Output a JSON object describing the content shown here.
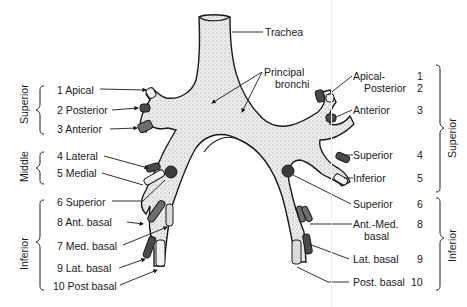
{
  "diagram": {
    "trachea_label": "Trachea",
    "principal_bronchi_label": [
      "Principal",
      "bronchi"
    ],
    "left_side": {
      "groups": [
        {
          "name": "Superior",
          "segments": [
            {
              "num": "1",
              "label": "1 Apical"
            },
            {
              "num": "2",
              "label": "2 Posterior"
            },
            {
              "num": "3",
              "label": "3 Anterior"
            }
          ]
        },
        {
          "name": "Middle",
          "segments": [
            {
              "num": "4",
              "label": "4 Lateral"
            },
            {
              "num": "5",
              "label": "5 Medial"
            }
          ]
        },
        {
          "name": "Inferior",
          "segments": [
            {
              "num": "6",
              "label": "6 Superior"
            },
            {
              "num": "8",
              "label": "8 Ant. basal"
            },
            {
              "num": "7",
              "label": "7 Med. basal"
            },
            {
              "num": "9",
              "label": "9 Lat. basal"
            },
            {
              "num": "10",
              "label": "10 Post basal"
            }
          ]
        }
      ]
    },
    "right_side": {
      "groups": [
        {
          "name": "Superior",
          "segments": [
            {
              "num": "1",
              "label": "Apical-"
            },
            {
              "num": "2",
              "label": "Posterior"
            },
            {
              "num": "3",
              "label": "Anterior"
            },
            {
              "num": "4",
              "label": "Superior"
            },
            {
              "num": "5",
              "label": "Inferior"
            }
          ]
        },
        {
          "name": "Inferior",
          "segments": [
            {
              "num": "6",
              "label": "Superior"
            },
            {
              "num": "8",
              "label": "Ant.-Med."
            },
            {
              "num": "",
              "label": "basal"
            },
            {
              "num": "9",
              "label": "Lat. basal"
            },
            {
              "num": "10",
              "label": "Post. basal"
            }
          ]
        }
      ]
    },
    "colors": {
      "airway_fill": "#e6e6e6",
      "stipple": "#9a9a9a",
      "outline": "#1a1a1a",
      "dark_segment": "#4a4a4a",
      "mid_segment": "#7a7a7a",
      "light_segment": "#d8d8d8"
    }
  }
}
